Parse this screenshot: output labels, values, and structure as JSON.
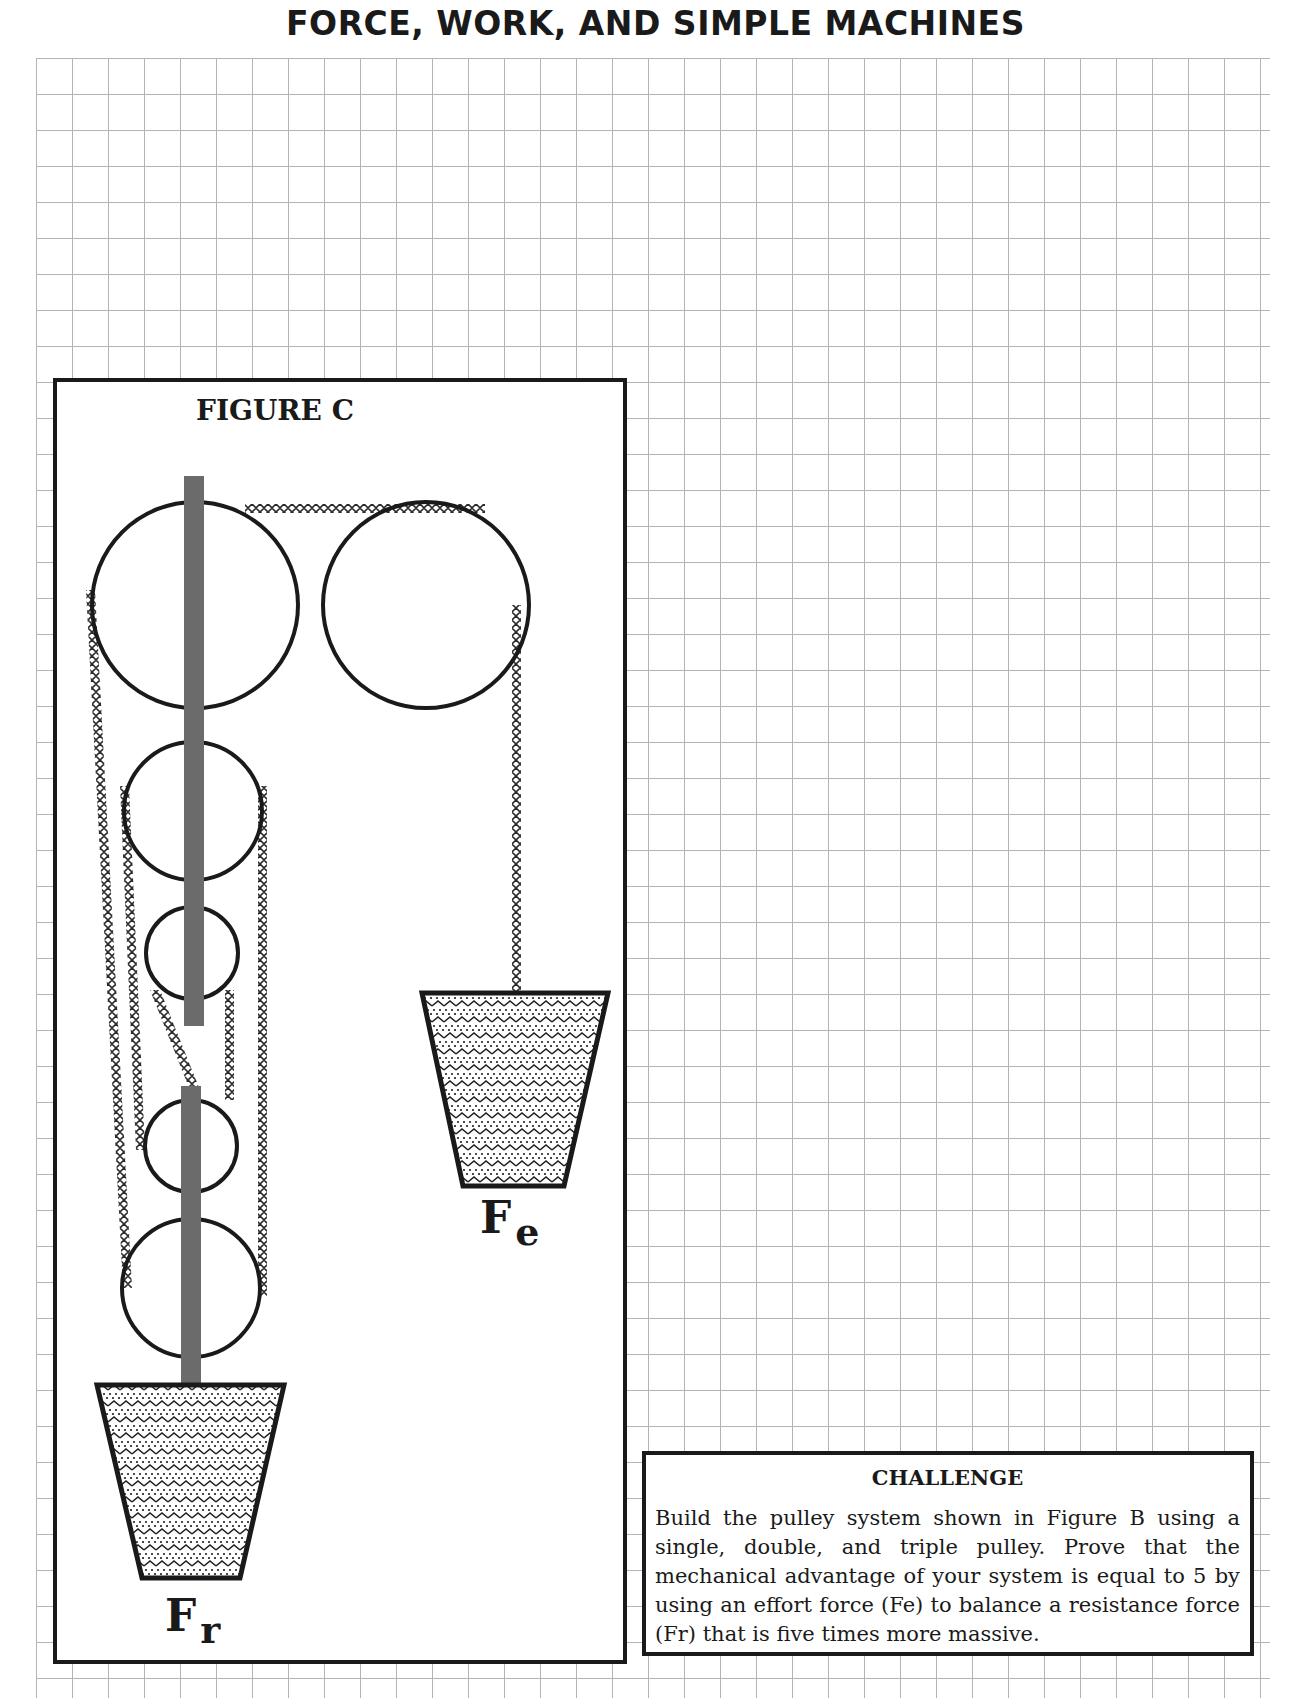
{
  "page": {
    "title": "FORCE, WORK, AND SIMPLE MACHINES",
    "background": "graph-paper-grid"
  },
  "figure": {
    "label": "FIGURE C",
    "components": {
      "pulleys_fixed_block": [
        "large-pulley-top-left",
        "large-pulley-top-right",
        "medium-pulley",
        "small-pulley-upper"
      ],
      "pulleys_movable_block": [
        "small-pulley-lower",
        "large-pulley-bottom"
      ],
      "ropes": "cross-stitch pattern rope",
      "weights": [
        "effort-bucket",
        "resistance-bucket"
      ]
    },
    "effort_label": {
      "main": "F",
      "sub": "e"
    },
    "resistance_label": {
      "main": "F",
      "sub": "r"
    }
  },
  "challenge": {
    "title": "CHALLENGE",
    "text": "Build the pulley system shown in Figure B using a single, double, and triple pulley. Prove that the mechanical advantage of your system is equal to 5 by using an effort force (Fe) to balance a resistance force (Fr) that is five times more massive."
  },
  "colors": {
    "ink": "#1a1a1a",
    "axle_bar": "#6b6b6b",
    "grid": "#9a9a9a"
  }
}
